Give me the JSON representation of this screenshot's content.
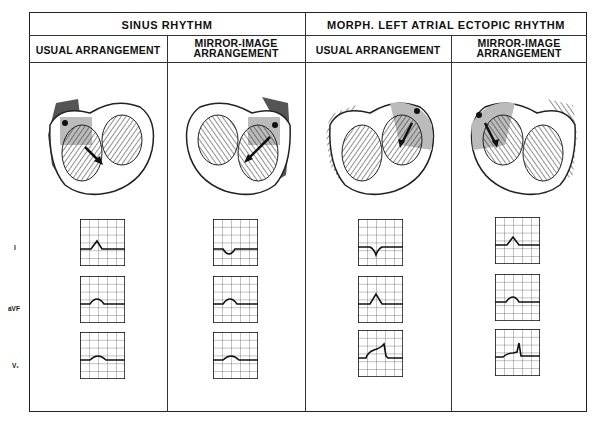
{
  "headers": {
    "sinus": "SINUS RHYTHM",
    "ectopic": "MORPH. LEFT ATRIAL ECTOPIC RHYTHM"
  },
  "columns": [
    {
      "label_1": "USUAL ARRANGEMENT",
      "label_2": ""
    },
    {
      "label_1": "MIRROR-IMAGE",
      "label_2": "ARRANGEMENT"
    },
    {
      "label_1": "USUAL ARRANGEMENT",
      "label_2": ""
    },
    {
      "label_1": "MIRROR-IMAGE",
      "label_2": "ARRANGEMENT"
    }
  ],
  "leads": [
    "I",
    "aVF",
    "V₁"
  ],
  "ecg": {
    "col1": {
      "I": "positive P",
      "aVF": "positive P",
      "V1": "positive P"
    },
    "col2": {
      "I": "negative P",
      "aVF": "positive P",
      "V1": "positive P"
    },
    "col3": {
      "I": "negative P",
      "aVF": "positive P",
      "V1": "dome and dart P"
    },
    "col4": {
      "I": "positive P",
      "aVF": "positive P",
      "V1": "dome and dart P"
    }
  },
  "colors": {
    "line": "#222222",
    "shade": "#b5b5b5",
    "dark": "#555555"
  }
}
